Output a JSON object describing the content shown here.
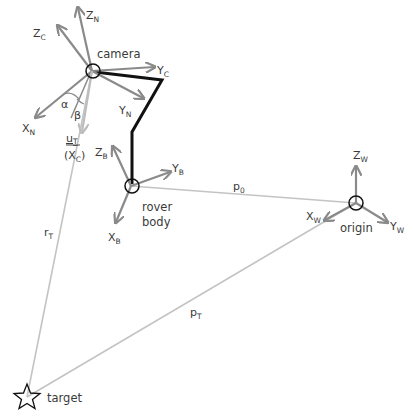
{
  "diagram": {
    "colors": {
      "axis": "#8a8a8a",
      "light_line": "#c4c4c4",
      "arm": "#111111",
      "text": "#3a3a3a",
      "circle": "#111111"
    },
    "nodes": {
      "camera": {
        "label": "camera",
        "x": 92,
        "y": 71
      },
      "rover_body": {
        "label_line1": "rover",
        "label_line2": "body",
        "x": 131,
        "y": 186
      },
      "origin": {
        "label": "origin",
        "x": 356,
        "y": 203
      },
      "target": {
        "label": "target",
        "x": 27,
        "y": 397
      }
    },
    "camera_axes": {
      "z_c": {
        "main": "Z",
        "sub": "C"
      },
      "z_n": {
        "main": "Z",
        "sub": "N"
      },
      "y_c": {
        "main": "Y",
        "sub": "C"
      },
      "y_n": {
        "main": "Y",
        "sub": "N"
      },
      "x_n": {
        "main": "X",
        "sub": "N"
      },
      "u_t": {
        "main": "u",
        "sub": "T"
      },
      "x_c": {
        "open": "(X",
        "sub": "C",
        "close": ")"
      },
      "alpha": "α",
      "beta": "β"
    },
    "body_axes": {
      "z_b": {
        "main": "Z",
        "sub": "B"
      },
      "y_b": {
        "main": "Y",
        "sub": "B"
      },
      "x_b": {
        "main": "X",
        "sub": "B"
      }
    },
    "world_axes": {
      "z_w": {
        "main": "Z",
        "sub": "W"
      },
      "x_w": {
        "main": "X",
        "sub": "W"
      },
      "y_w": {
        "main": "Y",
        "sub": "W"
      }
    },
    "vectors": {
      "p0": {
        "main": "p",
        "sub": "0"
      },
      "pT": {
        "main": "p",
        "sub": "T"
      },
      "rT": {
        "main": "r",
        "sub": "T"
      }
    }
  }
}
